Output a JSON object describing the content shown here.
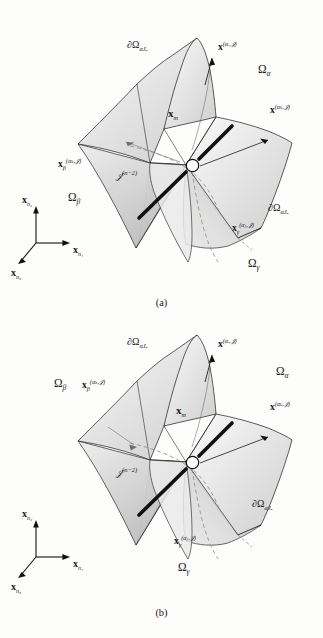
{
  "figure": {
    "type": "scientific-diagram",
    "background_color": "#fdfdfb",
    "line_color": "#1a1a1a",
    "surface_fill_light": "#f2f2f2",
    "surface_fill_mid": "#d9d9d9",
    "surface_fill_dark": "#bfbfbf"
  },
  "panels": [
    {
      "id": "a",
      "caption": "(a)",
      "labels": {
        "boundary_top": {
          "symbol": "∂Ω",
          "sub": "αJₐ"
        },
        "normal_top": {
          "bold": "x",
          "sup": "(αᵢ,𝒥)"
        },
        "normal_right": {
          "bold": "x",
          "sup": "(αₖ,𝒥)"
        },
        "normal_beta": {
          "bold": "x",
          "sub": "β",
          "sup": "(αₖ,𝒥)"
        },
        "normal_gamma": {
          "bold": "x",
          "sub": "γ",
          "sup": "(αⱼ,𝒥)"
        },
        "node": {
          "bold": "x",
          "sub": "m"
        },
        "junction": {
          "symbol": "𝒥",
          "sup": "(n−2)"
        },
        "domain_alpha": {
          "symbol": "Ω",
          "sub": "α"
        },
        "domain_beta": {
          "symbol": "Ω",
          "sub": "β"
        },
        "domain_gamma": {
          "symbol": "Ω",
          "sub": "γ"
        },
        "boundary_bottom": {
          "symbol": "∂Ω",
          "sub": "αJₐ"
        }
      },
      "axes": {
        "x1": {
          "bold": "x",
          "sub": "n₁"
        },
        "x2": {
          "bold": "x",
          "sub": "n₂"
        },
        "x3": {
          "bold": "x",
          "sub": "n₃"
        }
      }
    },
    {
      "id": "b",
      "caption": "(b)",
      "labels": {
        "boundary_top": {
          "symbol": "∂Ω",
          "sub": "αJₐ"
        },
        "normal_top": {
          "bold": "x",
          "sup": "(αᵢ,𝒥)"
        },
        "normal_right": {
          "bold": "x",
          "sup": "(αₖ,𝒥)"
        },
        "normal_beta": {
          "bold": "x",
          "sub": "β",
          "sup": "(αₖ,𝒥)"
        },
        "normal_gamma": {
          "bold": "x",
          "sub": "γ",
          "sup": "(αⱼ,𝒥)"
        },
        "node": {
          "bold": "x",
          "sub": "m"
        },
        "junction": {
          "symbol": "𝒥",
          "sup": "(n−2)"
        },
        "domain_alpha": {
          "symbol": "Ω",
          "sub": "α"
        },
        "domain_beta": {
          "symbol": "Ω",
          "sub": "β"
        },
        "domain_gamma": {
          "symbol": "Ω",
          "sub": "γ"
        },
        "boundary_bottom": {
          "symbol": "∂Ω",
          "sub": "αJₐ"
        }
      },
      "axes": {
        "x1": {
          "bold": "x",
          "sub": "n₁"
        },
        "x2": {
          "bold": "x",
          "sub": "n₂"
        },
        "x3": {
          "bold": "x",
          "sub": "n₃"
        }
      }
    }
  ]
}
